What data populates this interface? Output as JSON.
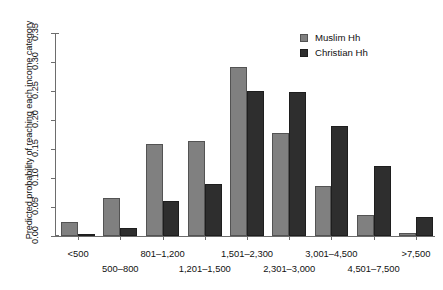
{
  "chart_data": {
    "type": "bar",
    "title": "",
    "xlabel": "",
    "ylabel": "Predicted probability of reaching each income category",
    "ylim": [
      0,
      0.35
    ],
    "grid": false,
    "legend_position": "top-right",
    "ytick_labels": [
      "0.00",
      "0.05",
      "0.10",
      "0.15",
      "0.20",
      "0.25",
      "0.30",
      "0.35"
    ],
    "ytick_values": [
      0.0,
      0.05,
      0.1,
      0.15,
      0.2,
      0.25,
      0.3,
      0.35
    ],
    "categories": [
      "<500",
      "500–800",
      "801–1,200",
      "1,201–1,500",
      "1,501–2,300",
      "2,301–3,000",
      "3,001–4,500",
      "4,501–7,500",
      ">7,500"
    ],
    "series": [
      {
        "name": "Muslim Hh",
        "color": "#808080",
        "values": [
          0.024,
          0.066,
          0.159,
          0.164,
          0.292,
          0.178,
          0.087,
          0.036,
          0.006
        ]
      },
      {
        "name": "Christian Hh",
        "color": "#2e2e2e",
        "values": [
          0.003,
          0.014,
          0.06,
          0.09,
          0.25,
          0.248,
          0.189,
          0.121,
          0.033
        ]
      }
    ]
  },
  "legend": {
    "items": [
      {
        "label": "Muslim Hh",
        "color": "#808080"
      },
      {
        "label": "Christian Hh",
        "color": "#2e2e2e"
      }
    ]
  },
  "axes": {
    "y_title": "Predicted probability of reaching each income category"
  }
}
